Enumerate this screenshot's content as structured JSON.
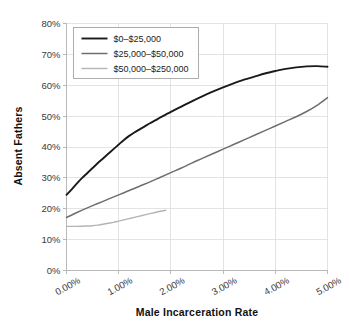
{
  "chart_data": {
    "type": "line",
    "title": "",
    "xlabel": "Male Incarceration Rate",
    "ylabel": "Absent Fathers",
    "xlim": [
      0,
      5
    ],
    "ylim": [
      0,
      80
    ],
    "grid": true,
    "legend_position": "top-left",
    "x_tick_labels": [
      "0.00%",
      "1.00%",
      "2.00%",
      "3.00%",
      "4.00%",
      "5.00%"
    ],
    "x_ticks": [
      0,
      1,
      2,
      3,
      4,
      5
    ],
    "y_tick_labels": [
      "0%",
      "10%",
      "20%",
      "30%",
      "40%",
      "50%",
      "60%",
      "70%",
      "80%"
    ],
    "y_ticks": [
      0,
      10,
      20,
      30,
      40,
      50,
      60,
      70,
      80
    ],
    "series": [
      {
        "name": "$0–$25,000",
        "color": "#1a1a1a",
        "width": 1.9,
        "x": [
          0.0,
          0.1,
          0.2,
          0.3,
          0.4,
          0.5,
          0.6,
          0.7,
          0.8,
          0.9,
          1.0,
          1.1,
          1.2,
          1.3,
          1.4,
          1.5,
          1.6,
          1.7,
          1.8,
          1.9,
          2.0,
          2.2,
          2.4,
          2.6,
          2.8,
          3.0,
          3.2,
          3.4,
          3.6,
          3.8,
          4.0,
          4.2,
          4.4,
          4.6,
          4.8,
          5.0
        ],
        "values": [
          24.5,
          26.3,
          28.2,
          30.0,
          31.6,
          33.2,
          34.8,
          36.3,
          37.8,
          39.3,
          40.8,
          42.3,
          43.6,
          44.7,
          45.7,
          46.7,
          47.7,
          48.6,
          49.6,
          50.5,
          51.4,
          53.1,
          54.8,
          56.4,
          57.9,
          59.3,
          60.6,
          61.8,
          62.8,
          63.8,
          64.6,
          65.3,
          65.8,
          66.1,
          66.2,
          66.0
        ]
      },
      {
        "name": "$25,000–$50,000",
        "color": "#6e6e6e",
        "width": 1.5,
        "x": [
          0.0,
          0.2,
          0.4,
          0.6,
          0.8,
          1.0,
          1.2,
          1.4,
          1.6,
          1.8,
          2.0,
          2.2,
          2.4,
          2.6,
          2.8,
          3.0,
          3.2,
          3.4,
          3.6,
          3.8,
          4.0,
          4.2,
          4.4,
          4.6,
          4.8,
          5.0
        ],
        "values": [
          17.2,
          18.8,
          20.3,
          21.7,
          23.1,
          24.5,
          25.9,
          27.3,
          28.7,
          30.2,
          31.7,
          33.2,
          34.8,
          36.3,
          37.8,
          39.3,
          40.8,
          42.3,
          43.8,
          45.3,
          46.8,
          48.3,
          49.8,
          51.5,
          53.5,
          56.0
        ]
      },
      {
        "name": "$50,000–$250,000",
        "color": "#b4b4b4",
        "width": 1.4,
        "x": [
          0.0,
          0.2,
          0.4,
          0.5,
          0.6,
          0.7,
          0.8,
          0.9,
          1.0,
          1.1,
          1.2,
          1.3,
          1.4,
          1.5,
          1.6,
          1.7,
          1.8,
          1.9
        ],
        "values": [
          14.3,
          14.3,
          14.4,
          14.5,
          14.7,
          15.0,
          15.3,
          15.6,
          16.0,
          16.4,
          16.8,
          17.2,
          17.6,
          18.0,
          18.4,
          18.8,
          19.2,
          19.5
        ]
      }
    ]
  },
  "legend": {
    "entries": [
      {
        "label": "$0–$25,000"
      },
      {
        "label": "$25,000–$50,000"
      },
      {
        "label": "$50,000–$250,000"
      }
    ]
  }
}
